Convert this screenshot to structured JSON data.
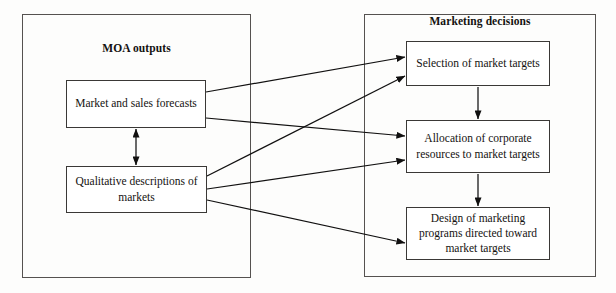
{
  "diagram": {
    "groups": {
      "left": {
        "title": "MOA outputs"
      },
      "right": {
        "title": "Marketing decisions"
      }
    },
    "nodes": {
      "forecasts": "Market and sales forecasts",
      "qualitative": "Qualitative descriptions of markets",
      "selection": "Selection of market targets",
      "allocation": "Allocation of corporate resources to market targets",
      "design": "Design of marketing programs directed toward market targets"
    },
    "edges": [
      {
        "from": "forecasts",
        "to": "selection",
        "style": "arrow"
      },
      {
        "from": "forecasts",
        "to": "allocation",
        "style": "arrow"
      },
      {
        "from": "qualitative",
        "to": "selection",
        "style": "arrow"
      },
      {
        "from": "qualitative",
        "to": "allocation",
        "style": "arrow"
      },
      {
        "from": "qualitative",
        "to": "design",
        "style": "arrow"
      },
      {
        "from": "forecasts",
        "to": "qualitative",
        "style": "double-arrow"
      },
      {
        "from": "selection",
        "to": "allocation",
        "style": "arrow"
      },
      {
        "from": "allocation",
        "to": "design",
        "style": "arrow"
      }
    ],
    "colors": {
      "line": "#111010",
      "border": "#3a3836",
      "container_border": "#555250",
      "text": "#141210",
      "background": "#fdfdfc"
    }
  }
}
